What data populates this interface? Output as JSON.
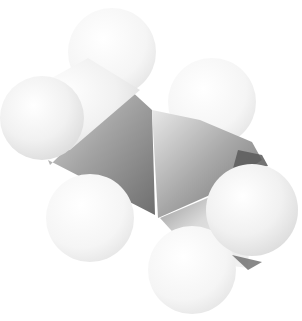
{
  "image": {
    "subject": "space-filling molecular model",
    "style": "grayscale 3D render",
    "background": "#ffffff",
    "atoms": [
      {
        "role": "hydrogen",
        "position": "top-center"
      },
      {
        "role": "hydrogen",
        "position": "upper-left"
      },
      {
        "role": "hydrogen",
        "position": "upper-right"
      },
      {
        "role": "hydrogen",
        "position": "lower-left"
      },
      {
        "role": "hydrogen",
        "position": "lower-center"
      },
      {
        "role": "hydrogen",
        "position": "right"
      },
      {
        "role": "carbon",
        "position": "left-center"
      },
      {
        "role": "carbon",
        "position": "right-center"
      }
    ],
    "colors": {
      "sphere_light": "#f7f7f7",
      "sphere_mid": "#e6e6e6",
      "body_dark": "#7a7a7a",
      "body_mid": "#a8a8a8",
      "edge_dark": "#555555"
    }
  }
}
